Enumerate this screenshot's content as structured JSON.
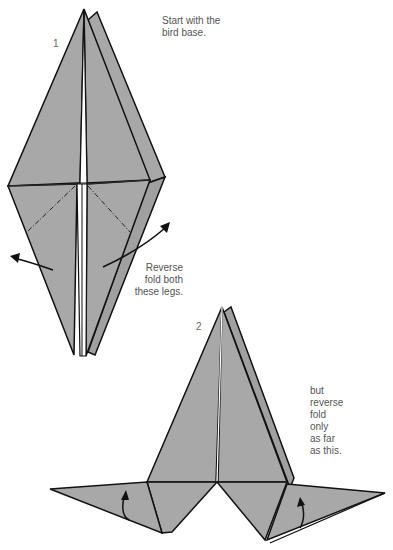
{
  "steps": [
    {
      "number": "1",
      "caption_lines": [
        "Start with the",
        "bird base."
      ],
      "instruction_lines": [
        "Reverse",
        "fold both",
        "these legs."
      ]
    },
    {
      "number": "2",
      "instruction_lines": [
        "but",
        "reverse",
        "fold",
        "only",
        "as far",
        "as this."
      ]
    }
  ],
  "colors": {
    "paper": "#a8a8a8",
    "outline": "#111111",
    "background": "#ffffff",
    "text": "#555555"
  }
}
